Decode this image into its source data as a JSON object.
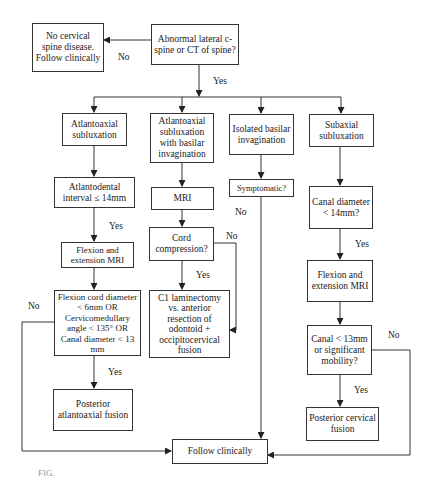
{
  "nodes": {
    "start": "Abnormal lateral c-spine or CT of spine?",
    "no_disease": "No cervical spine disease. Follow clinically",
    "aa_sub": "Atlantoaxial subluxation",
    "aa_basilar": "Atlantoaxial subluxation with basilar invagination",
    "isolated_basilar": "Isolated basilar invagination",
    "subaxial": "Subaxial subluxation",
    "adi": "Atlantodental interval ≤ 14mm",
    "mri": "MRI",
    "symptomatic": "Symptomatic?",
    "canal_diam": "Canal diameter < 14mm?",
    "flex_mri_left": "Flexion and extension MRI",
    "cord_compression": "Cord compression?",
    "flex_mri_right": "Flexion and extension MRI",
    "criteria_left": "Flexion cord diameter < 6mm OR Cervicomedullary angle < 135° OR Canal diameter < 13 mm",
    "c1_laminectomy": "C1 laminectomy vs. anterior resection of odontoid + occipitocervical fusion",
    "canal_13": "Canal < 13mm or significant mobility?",
    "post_aa_fusion": "Posterior atlantoaxial fusion",
    "post_cerv_fusion": "Posterior cervical fusion",
    "follow": "Follow clinically"
  },
  "edge_labels": {
    "start_no": "No",
    "start_yes": "Yes",
    "adi_yes": "Yes",
    "cord_no": "No",
    "cord_yes": "Yes",
    "symptomatic_no": "No",
    "canal_diam_yes": "Yes",
    "criteria_no": "No",
    "criteria_yes": "Yes",
    "canal13_no": "No",
    "canal13_yes": "Yes"
  },
  "caption": "FIG."
}
